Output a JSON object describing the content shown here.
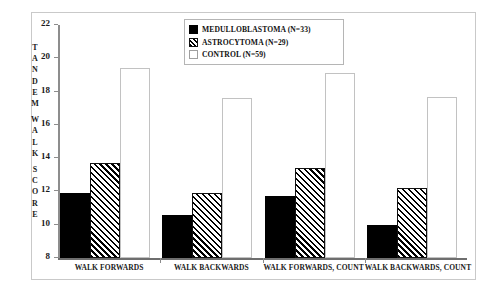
{
  "chart_data": {
    "type": "bar",
    "title": "",
    "xlabel": "",
    "ylabel": "TANDEM WALK SCORE",
    "ylim": [
      8,
      22
    ],
    "yticks": [
      8,
      10,
      12,
      14,
      16,
      18,
      20,
      22
    ],
    "ytick_labels": [
      "8",
      "10",
      "12",
      "14",
      "16",
      "18",
      "20",
      "22"
    ],
    "grid": false,
    "legend_position": "top-center",
    "categories": [
      "WALK FORWARDS",
      "WALK BACKWARDS",
      "WALK FORWARDS, COUNT",
      "WALK BACKWARDS, COUNT"
    ],
    "series": [
      {
        "name": "MEDULLOBLASTOMA (N=33)",
        "label": "MEDULLOBLASTOMA",
        "n": 33,
        "fill": "solid-black",
        "color": "#000000",
        "values": [
          11.9,
          10.6,
          11.7,
          10.0
        ]
      },
      {
        "name": "ASTROCYTOMA (N=29)",
        "label": "ASTROCYTOMA",
        "n": 29,
        "fill": "diagonal-hatch",
        "color": "#000000",
        "values": [
          13.7,
          11.9,
          13.4,
          12.2
        ]
      },
      {
        "name": "CONTROL (N=59)",
        "label": "CONTROL",
        "n": 59,
        "fill": "white",
        "color": "#ffffff",
        "values": [
          19.4,
          17.6,
          19.1,
          17.7
        ]
      }
    ]
  },
  "legend": {
    "items": [
      {
        "label": "MEDULLOBLASTOMA (N=33)",
        "swatch": "sw-medulloblastoma"
      },
      {
        "label": "ASTROCYTOMA (N=29)",
        "swatch": "sw-astrocytoma"
      },
      {
        "label": "CONTROL (N=59)",
        "swatch": "sw-control"
      }
    ]
  },
  "axis": {
    "y_title_chars": [
      "T",
      "A",
      "N",
      "D",
      "E",
      "M",
      "",
      "W",
      "A",
      "L",
      "K",
      "",
      "S",
      "C",
      "O",
      "R",
      "E"
    ]
  }
}
